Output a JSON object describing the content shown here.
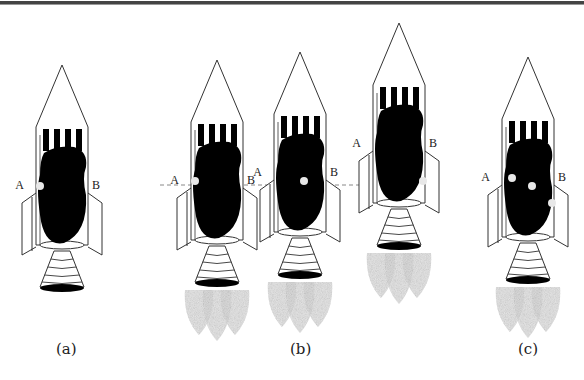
{
  "figure": {
    "captions": [
      "(a)",
      "(b)",
      "(c)"
    ],
    "point_labels": {
      "left": "A",
      "right": "B"
    },
    "colors": {
      "outline": "#333333",
      "fill": "#000000",
      "exhaust": "#c8c8c8",
      "dot": "#e8e8e8",
      "dashed_line": "#888888"
    },
    "rockets": [
      {
        "id": "a",
        "dx": 0,
        "dy": 0,
        "flames": false,
        "dots": [
          [
            -26,
            125
          ]
        ]
      },
      {
        "id": "b1",
        "dx": 155,
        "dy": -5,
        "flames": true,
        "dots": [
          [
            -26,
            125
          ]
        ]
      },
      {
        "id": "b2",
        "dx": 238,
        "dy": -13,
        "flames": true,
        "dots": [
          [
            0,
            133
          ]
        ]
      },
      {
        "id": "b3",
        "dx": 337,
        "dy": -42,
        "flames": true,
        "dots": [
          [
            20,
            162
          ]
        ]
      },
      {
        "id": "c",
        "dx": 466,
        "dy": -8,
        "flames": true,
        "dots": [
          [
            -20,
            125
          ],
          [
            0,
            133
          ],
          [
            20,
            150
          ]
        ]
      }
    ],
    "dashed_line_y": 185
  }
}
